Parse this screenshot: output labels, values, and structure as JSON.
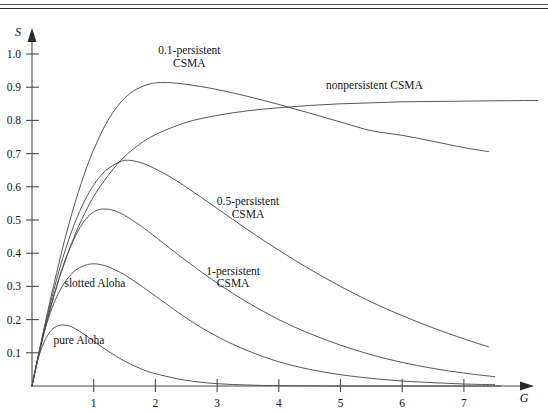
{
  "figure": {
    "axis_y_name": "S",
    "axis_x_name": "G",
    "y_ticks": [
      "1.0",
      "0.9",
      "0.8",
      "0.7",
      "0.6",
      "0.5",
      "0.4",
      "0.3",
      "0.2",
      "0.1"
    ],
    "x_ticks": [
      "1",
      "2",
      "3",
      "4",
      "5",
      "6",
      "7"
    ],
    "labels": {
      "p01_line1": "0.1-persistent",
      "p01_line2": "CSMA",
      "nonpersistent": "nonpersistent CSMA",
      "p05_line1": "0.5-persistent",
      "p05_line2": "CSMA",
      "p1_line1": "1-persistent",
      "p1_line2": "CSMA",
      "slotted_aloha": "slotted Aloha",
      "pure_aloha": "pure Aloha"
    }
  },
  "chart_data": {
    "type": "line",
    "title": "",
    "xlabel": "G",
    "ylabel": "S",
    "xlim": [
      0,
      8.2
    ],
    "ylim": [
      0,
      1.05
    ],
    "grid": false,
    "legend": "inline-annotations",
    "series": [
      {
        "name": "0.1-persistent CSMA",
        "label_x": 2.55,
        "label_y": 1.0,
        "points": [
          [
            0.0,
            0.0
          ],
          [
            0.1,
            0.09
          ],
          [
            0.2,
            0.178
          ],
          [
            0.3,
            0.262
          ],
          [
            0.4,
            0.342
          ],
          [
            0.5,
            0.418
          ],
          [
            0.6,
            0.489
          ],
          [
            0.7,
            0.553
          ],
          [
            0.8,
            0.612
          ],
          [
            0.9,
            0.665
          ],
          [
            1.0,
            0.712
          ],
          [
            1.2,
            0.79
          ],
          [
            1.4,
            0.846
          ],
          [
            1.6,
            0.883
          ],
          [
            1.8,
            0.903
          ],
          [
            2.0,
            0.913
          ],
          [
            2.2,
            0.914
          ],
          [
            2.4,
            0.911
          ],
          [
            2.7,
            0.903
          ],
          [
            3.0,
            0.893
          ],
          [
            3.5,
            0.872
          ],
          [
            4.0,
            0.848
          ],
          [
            4.5,
            0.822
          ],
          [
            5.0,
            0.795
          ],
          [
            5.5,
            0.769
          ],
          [
            6.0,
            0.755
          ],
          [
            6.5,
            0.737
          ],
          [
            7.0,
            0.718
          ],
          [
            7.4,
            0.706
          ]
        ]
      },
      {
        "name": "nonpersistent CSMA",
        "label_x": 5.55,
        "label_y": 0.895,
        "points": [
          [
            0.0,
            0.0
          ],
          [
            0.1,
            0.085
          ],
          [
            0.2,
            0.163
          ],
          [
            0.3,
            0.234
          ],
          [
            0.4,
            0.299
          ],
          [
            0.5,
            0.357
          ],
          [
            0.7,
            0.457
          ],
          [
            0.9,
            0.537
          ],
          [
            1.1,
            0.6
          ],
          [
            1.4,
            0.672
          ],
          [
            1.7,
            0.722
          ],
          [
            2.0,
            0.757
          ],
          [
            2.5,
            0.794
          ],
          [
            3.0,
            0.815
          ],
          [
            3.5,
            0.829
          ],
          [
            4.0,
            0.838
          ],
          [
            4.5,
            0.845
          ],
          [
            5.0,
            0.85
          ],
          [
            5.5,
            0.853
          ],
          [
            6.0,
            0.856
          ],
          [
            6.5,
            0.857
          ],
          [
            7.0,
            0.858
          ],
          [
            7.5,
            0.859
          ],
          [
            8.2,
            0.86
          ]
        ]
      },
      {
        "name": "0.5-persistent CSMA",
        "label_x": 3.5,
        "label_y": 0.545,
        "points": [
          [
            0.0,
            0.0
          ],
          [
            0.1,
            0.088
          ],
          [
            0.2,
            0.172
          ],
          [
            0.3,
            0.25
          ],
          [
            0.4,
            0.322
          ],
          [
            0.5,
            0.386
          ],
          [
            0.6,
            0.443
          ],
          [
            0.7,
            0.494
          ],
          [
            0.85,
            0.557
          ],
          [
            1.0,
            0.605
          ],
          [
            1.15,
            0.641
          ],
          [
            1.3,
            0.663
          ],
          [
            1.45,
            0.677
          ],
          [
            1.55,
            0.68
          ],
          [
            1.7,
            0.676
          ],
          [
            1.9,
            0.663
          ],
          [
            2.2,
            0.634
          ],
          [
            2.5,
            0.599
          ],
          [
            3.0,
            0.535
          ],
          [
            3.5,
            0.47
          ],
          [
            4.0,
            0.409
          ],
          [
            4.5,
            0.352
          ],
          [
            5.0,
            0.3
          ],
          [
            5.5,
            0.253
          ],
          [
            6.0,
            0.212
          ],
          [
            6.5,
            0.175
          ],
          [
            7.0,
            0.142
          ],
          [
            7.4,
            0.118
          ]
        ]
      },
      {
        "name": "1-persistent CSMA",
        "label_x": 3.26,
        "label_y": 0.335,
        "points": [
          [
            0.0,
            0.0
          ],
          [
            0.1,
            0.086
          ],
          [
            0.2,
            0.166
          ],
          [
            0.3,
            0.238
          ],
          [
            0.4,
            0.302
          ],
          [
            0.5,
            0.359
          ],
          [
            0.6,
            0.409
          ],
          [
            0.75,
            0.468
          ],
          [
            0.9,
            0.509
          ],
          [
            1.05,
            0.529
          ],
          [
            1.2,
            0.533
          ],
          [
            1.35,
            0.527
          ],
          [
            1.5,
            0.514
          ],
          [
            1.75,
            0.484
          ],
          [
            2.0,
            0.449
          ],
          [
            2.5,
            0.377
          ],
          [
            3.0,
            0.31
          ],
          [
            3.5,
            0.251
          ],
          [
            4.0,
            0.2
          ],
          [
            4.5,
            0.158
          ],
          [
            5.0,
            0.123
          ],
          [
            5.5,
            0.094
          ],
          [
            6.0,
            0.071
          ],
          [
            6.5,
            0.053
          ],
          [
            7.0,
            0.039
          ],
          [
            7.5,
            0.028
          ]
        ]
      },
      {
        "name": "slotted Aloha",
        "label_x": 1.02,
        "label_y": 0.298,
        "points": [
          [
            0.0,
            0.0
          ],
          [
            0.1,
            0.09
          ],
          [
            0.2,
            0.164
          ],
          [
            0.3,
            0.222
          ],
          [
            0.4,
            0.268
          ],
          [
            0.5,
            0.303
          ],
          [
            0.6,
            0.329
          ],
          [
            0.7,
            0.348
          ],
          [
            0.8,
            0.359
          ],
          [
            0.9,
            0.366
          ],
          [
            1.0,
            0.368
          ],
          [
            1.1,
            0.366
          ],
          [
            1.25,
            0.358
          ],
          [
            1.5,
            0.335
          ],
          [
            1.75,
            0.304
          ],
          [
            2.0,
            0.271
          ],
          [
            2.5,
            0.205
          ],
          [
            3.0,
            0.149
          ],
          [
            3.5,
            0.106
          ],
          [
            4.0,
            0.073
          ],
          [
            4.5,
            0.05
          ],
          [
            5.0,
            0.034
          ],
          [
            5.5,
            0.023
          ],
          [
            6.0,
            0.015
          ],
          [
            6.5,
            0.01
          ],
          [
            7.0,
            0.006
          ],
          [
            7.5,
            0.004
          ]
        ]
      },
      {
        "name": "pure Aloha",
        "label_x": 0.76,
        "label_y": 0.128,
        "points": [
          [
            0.0,
            0.0
          ],
          [
            0.1,
            0.082
          ],
          [
            0.2,
            0.134
          ],
          [
            0.3,
            0.165
          ],
          [
            0.4,
            0.18
          ],
          [
            0.5,
            0.184
          ],
          [
            0.6,
            0.181
          ],
          [
            0.7,
            0.173
          ],
          [
            0.85,
            0.155
          ],
          [
            1.0,
            0.135
          ],
          [
            1.25,
            0.103
          ],
          [
            1.5,
            0.075
          ],
          [
            1.75,
            0.053
          ],
          [
            2.0,
            0.037
          ],
          [
            2.5,
            0.017
          ],
          [
            3.0,
            0.007
          ],
          [
            3.5,
            0.003
          ],
          [
            4.0,
            0.001
          ],
          [
            5.0,
            0.0
          ],
          [
            6.0,
            0.0
          ],
          [
            7.0,
            0.0
          ],
          [
            7.6,
            0.0
          ]
        ]
      }
    ]
  }
}
